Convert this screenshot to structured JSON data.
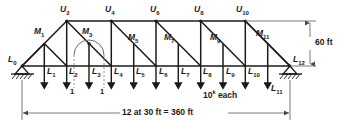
{
  "figure": {
    "colors": {
      "member": "#1a1a1a",
      "dimension": "#555555",
      "dashed": "#777777",
      "background": "#ffffff"
    }
  },
  "top_chord_nodes": [
    {
      "label": "U",
      "sub": "2"
    },
    {
      "label": "U",
      "sub": "4"
    },
    {
      "label": "U",
      "sub": "6"
    },
    {
      "label": "U",
      "sub": "8"
    },
    {
      "label": "U",
      "sub": "10"
    }
  ],
  "mid_nodes": [
    {
      "label": "M",
      "sub": "1"
    },
    {
      "label": "M",
      "sub": "3"
    },
    {
      "label": "M",
      "sub": "5"
    },
    {
      "label": "M",
      "sub": "7"
    },
    {
      "label": "M",
      "sub": "9"
    },
    {
      "label": "M",
      "sub": "11"
    }
  ],
  "bottom_chord_nodes": [
    {
      "label": "L",
      "sub": "0"
    },
    {
      "label": "L",
      "sub": "1"
    },
    {
      "label": "L",
      "sub": "2"
    },
    {
      "label": "L",
      "sub": "3"
    },
    {
      "label": "L",
      "sub": "4"
    },
    {
      "label": "L",
      "sub": "5"
    },
    {
      "label": "L",
      "sub": "6"
    },
    {
      "label": "L",
      "sub": "7"
    },
    {
      "label": "L",
      "sub": "8"
    },
    {
      "label": "L",
      "sub": "9"
    },
    {
      "label": "L",
      "sub": "10"
    },
    {
      "label": "L",
      "sub": "11"
    },
    {
      "label": "L",
      "sub": "12"
    }
  ],
  "annotations": {
    "unit_load_left": "1",
    "unit_load_right": "1",
    "load_magnitude": "10",
    "load_magnitude_exp": "k",
    "load_magnitude_suffix": " each",
    "height_dimension": "60 ft",
    "span_dimension": "12 at 30 ft = 360 ft"
  },
  "supports": {
    "left": "pin-support-hatched",
    "right": "roller-support-hatched"
  },
  "geometry": {
    "panels": 12,
    "panel_width_ft": 30,
    "span_ft": 360,
    "height_ft": 60
  }
}
